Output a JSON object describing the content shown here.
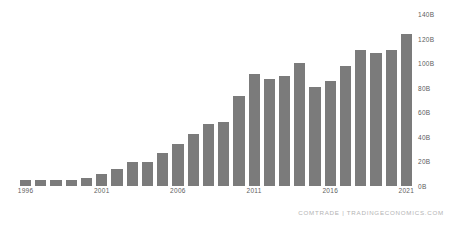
{
  "chart_data": {
    "type": "bar",
    "title": "",
    "subtitle": "",
    "xlabel": "",
    "ylabel": "",
    "grid": false,
    "legend": null,
    "bar_color": "#7b7b7b",
    "ylim": [
      0,
      140
    ],
    "y_unit": "B",
    "y_ticks": [
      {
        "value": 140,
        "label": "140B"
      },
      {
        "value": 120,
        "label": "120B"
      },
      {
        "value": 100,
        "label": "100B"
      },
      {
        "value": 80,
        "label": "80B"
      },
      {
        "value": 60,
        "label": "60B"
      },
      {
        "value": 40,
        "label": "40B"
      },
      {
        "value": 20,
        "label": "20B"
      },
      {
        "value": 0,
        "label": "0B"
      }
    ],
    "x_tick_labels": [
      {
        "category": "1996",
        "label": "1996"
      },
      {
        "category": "2001",
        "label": "2001"
      },
      {
        "category": "2006",
        "label": "2006"
      },
      {
        "category": "2011",
        "label": "2011"
      },
      {
        "category": "2016",
        "label": "2016"
      },
      {
        "category": "2021",
        "label": "2021"
      }
    ],
    "categories": [
      "1996",
      "1997",
      "1998",
      "1999",
      "2000",
      "2001",
      "2002",
      "2003",
      "2004",
      "2005",
      "2006",
      "2007",
      "2008",
      "2009",
      "2010",
      "2011",
      "2012",
      "2013",
      "2014",
      "2015",
      "2016",
      "2017",
      "2018",
      "2019",
      "2020",
      "2021"
    ],
    "values": [
      4.5,
      4.6,
      4.7,
      5.2,
      6.5,
      9.5,
      13.5,
      19.5,
      19.5,
      26.5,
      34.5,
      42.5,
      50.5,
      52.5,
      73.5,
      91.5,
      87.5,
      89.5,
      100.5,
      80.5,
      85.5,
      97.5,
      110.5,
      108.5,
      110.5,
      124.0
    ]
  },
  "footer": {
    "credit": "COMTRADE | TRADINGECONOMICS.COM"
  }
}
